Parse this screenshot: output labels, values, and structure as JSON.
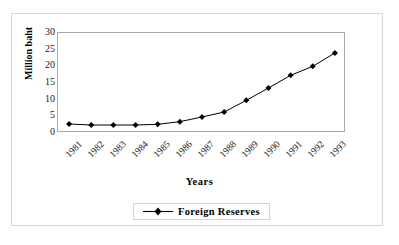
{
  "chart_data": {
    "type": "line",
    "title": "",
    "xlabel": "Years",
    "ylabel": "Million baht",
    "categories": [
      "1981",
      "1982",
      "1983",
      "1984",
      "1985",
      "1986",
      "1987",
      "1988",
      "1989",
      "1990",
      "1991",
      "1992",
      "1993"
    ],
    "series": [
      {
        "name": "Foreign Reserves",
        "marker": "diamond",
        "color": "#000000",
        "values": [
          2.7,
          2.4,
          2.4,
          2.4,
          2.6,
          3.4,
          4.8,
          6.3,
          9.8,
          13.5,
          17.3,
          20.0,
          24.0
        ]
      }
    ],
    "ylim": [
      0,
      30
    ],
    "yticks": [
      0,
      5,
      10,
      15,
      20,
      25,
      30
    ],
    "ytick_labels": [
      "0",
      "5",
      "10",
      "15",
      "20",
      "25",
      "30"
    ],
    "grid": false,
    "legend_position": "bottom"
  },
  "axes": {
    "y_title": "Million baht",
    "x_title": "Years"
  },
  "legend": {
    "entries": [
      {
        "label": "Foreign Reserves",
        "marker_icon": "diamond-marker-icon"
      }
    ]
  },
  "colors": {
    "series": "#000000",
    "plot_border": "#a9a9a9",
    "outer_frame": "#d8d8d8",
    "background": "#ffffff",
    "text": "#1a1a1a"
  }
}
